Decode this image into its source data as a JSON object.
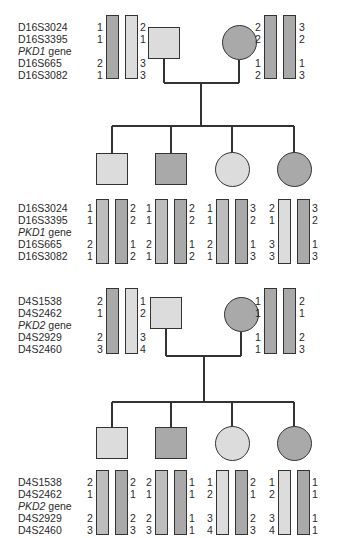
{
  "colors": {
    "light": "#dcdcdc",
    "medium": "#bdbdbd",
    "dark": "#a9a9a9",
    "line": "#333333"
  },
  "pedigrees": [
    {
      "gene": "PKD1",
      "markers": [
        "D16S3024",
        "D16S3395",
        "PKD1 gene",
        "D16S665",
        "D16S3082"
      ],
      "marker_labels": {
        "m0": "D16S3024",
        "m1": "D16S3395",
        "gene_italic": "PKD1",
        "gene_suffix": " gene",
        "m3": "D16S665",
        "m4": "D16S3082"
      },
      "father": {
        "shape": "square",
        "fill": "light",
        "haplotypes": [
          [
            "1",
            "1",
            "2",
            "1"
          ],
          [
            "2",
            "1",
            "3",
            "3"
          ]
        ],
        "bar_fills": [
          "dark",
          "light"
        ]
      },
      "mother": {
        "shape": "circle",
        "fill": "dark",
        "haplotypes": [
          [
            "2",
            "2",
            "1",
            "2"
          ],
          [
            "3",
            "2",
            "1",
            "3"
          ]
        ],
        "bar_fills": [
          "dark",
          "dark"
        ]
      },
      "children": [
        {
          "shape": "square",
          "fill": "light",
          "haplotypes": [
            [
              "1",
              "1",
              "2",
              "1"
            ],
            [
              "2",
              "2",
              "1",
              "2"
            ]
          ],
          "bar_fills": [
            "medium",
            "dark"
          ]
        },
        {
          "shape": "square",
          "fill": "dark",
          "haplotypes": [
            [
              "1",
              "1",
              "2",
              "1"
            ],
            [
              "2",
              "2",
              "1",
              "2"
            ]
          ],
          "bar_fills": [
            "medium",
            "dark"
          ]
        },
        {
          "shape": "circle",
          "fill": "light",
          "haplotypes": [
            [
              "1",
              "1",
              "2",
              "1"
            ],
            [
              "3",
              "2",
              "1",
              "3"
            ]
          ],
          "bar_fills": [
            "medium",
            "dark"
          ]
        },
        {
          "shape": "circle",
          "fill": "dark",
          "haplotypes": [
            [
              "2",
              "1",
              "3",
              "3"
            ],
            [
              "3",
              "2",
              "1",
              "3"
            ]
          ],
          "bar_fills": [
            "light",
            "dark"
          ]
        }
      ]
    },
    {
      "gene": "PKD2",
      "markers": [
        "D4S1538",
        "D4S2462",
        "PKD2 gene",
        "D4S2929",
        "D4S2460"
      ],
      "marker_labels": {
        "m0": "D4S1538",
        "m1": "D4S2462",
        "gene_italic": "PKD2",
        "gene_suffix": " gene",
        "m3": "D4S2929",
        "m4": "D4S2460"
      },
      "father": {
        "shape": "square",
        "fill": "light",
        "haplotypes": [
          [
            "2",
            "1",
            "2",
            "3"
          ],
          [
            "1",
            "2",
            "3",
            "4"
          ]
        ],
        "bar_fills": [
          "dark",
          "light"
        ]
      },
      "mother": {
        "shape": "circle",
        "fill": "dark",
        "haplotypes": [
          [
            "1",
            "1",
            "1",
            "1"
          ],
          [
            "2",
            "1",
            "2",
            "3"
          ]
        ],
        "bar_fills": [
          "dark",
          "dark"
        ]
      },
      "children": [
        {
          "shape": "square",
          "fill": "light",
          "haplotypes": [
            [
              "2",
              "1",
              "2",
              "3"
            ],
            [
              "2",
              "1",
              "2",
              "3"
            ]
          ],
          "bar_fills": [
            "medium",
            "dark"
          ]
        },
        {
          "shape": "square",
          "fill": "dark",
          "haplotypes": [
            [
              "2",
              "1",
              "2",
              "3"
            ],
            [
              "1",
              "1",
              "1",
              "1"
            ]
          ],
          "bar_fills": [
            "medium",
            "dark"
          ]
        },
        {
          "shape": "circle",
          "fill": "light",
          "haplotypes": [
            [
              "1",
              "2",
              "3",
              "4"
            ],
            [
              "2",
              "1",
              "2",
              "3"
            ]
          ],
          "bar_fills": [
            "light",
            "dark"
          ]
        },
        {
          "shape": "circle",
          "fill": "dark",
          "haplotypes": [
            [
              "1",
              "2",
              "3",
              "4"
            ],
            [
              "1",
              "1",
              "1",
              "1"
            ]
          ],
          "bar_fills": [
            "light",
            "dark"
          ]
        }
      ]
    }
  ]
}
